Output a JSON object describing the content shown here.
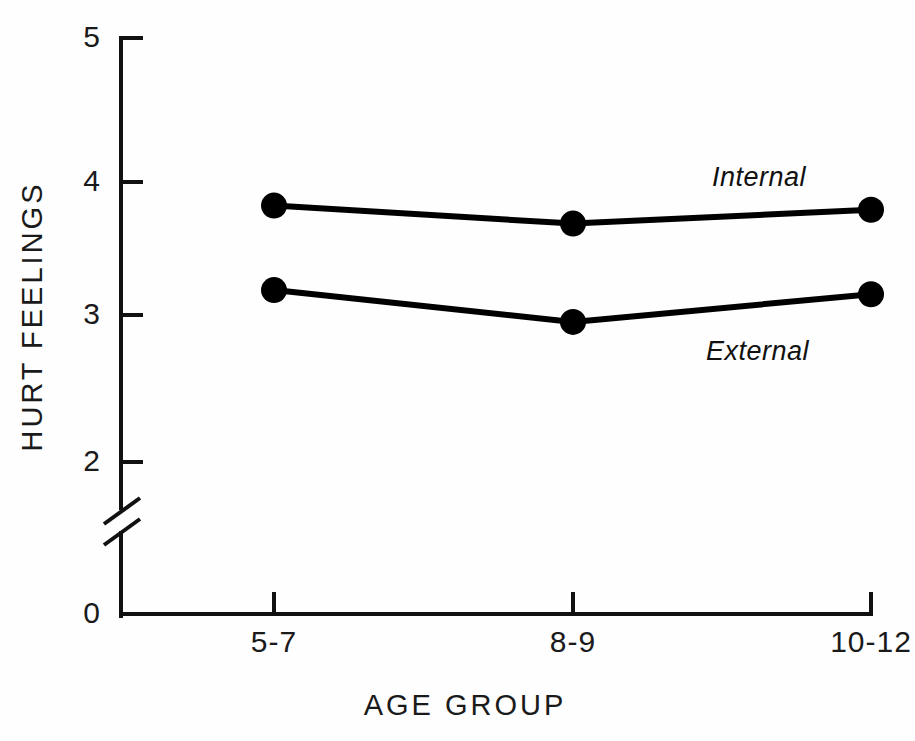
{
  "chart_data": {
    "type": "line",
    "title": "",
    "xlabel": "AGE GROUP",
    "ylabel": "HURT FEELINGS",
    "categories": [
      "5-7",
      "8-9",
      "10-12"
    ],
    "series": [
      {
        "name": "Internal",
        "values": [
          3.79,
          3.66,
          3.76
        ]
      },
      {
        "name": "External",
        "values": [
          3.18,
          2.95,
          3.15
        ]
      }
    ],
    "ylim": [
      0,
      5
    ],
    "y_ticks": [
      0,
      2,
      3,
      4,
      5
    ],
    "y_tick_labels": [
      "0",
      "2",
      "3",
      "4",
      "5"
    ],
    "y_axis_break": true,
    "y_axis_break_between": [
      0,
      2
    ],
    "grid": false,
    "legend": "inline-annotations",
    "marker": "filled-circle",
    "line_color": "#000000",
    "marker_color": "#000000",
    "background_color": "#FEFEFE"
  },
  "axes": {
    "y_title": "HURT FEELINGS",
    "x_title": "AGE GROUP",
    "y_tick_labels": [
      "5",
      "4",
      "3",
      "2",
      "0"
    ],
    "x_tick_labels": [
      "5-7",
      "8-9",
      "10-12"
    ]
  },
  "annotations": {
    "internal_label": "Internal",
    "external_label": "External"
  }
}
